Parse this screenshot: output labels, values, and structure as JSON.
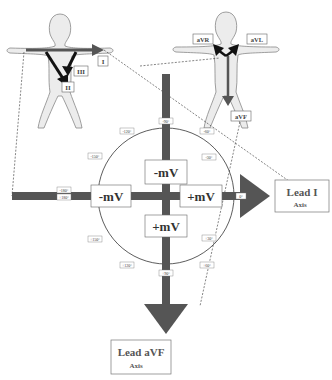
{
  "header": {
    "caption_fragment": ""
  },
  "figure": {
    "limb_leads_figure": {
      "labels": [
        "I",
        "II",
        "III"
      ]
    },
    "augmented_leads_figure": {
      "labels": [
        "aVR",
        "aVL",
        "aVF"
      ]
    },
    "hexaxial": {
      "degree_labels": {
        "top": "-90°",
        "upper_left": "-120°",
        "upper_right": "-60°",
        "right_upper": "-30°",
        "left_upper": "-150°",
        "left_top": "-180°",
        "left_bottom": "+180°",
        "right": "0°",
        "right_lower": "+30°",
        "lower_right": "+60°",
        "bottom": "+90°",
        "lower_left": "+120°",
        "left_lower": "+150°"
      },
      "quadrant_labels": {
        "top": "-mV",
        "left": "-mV",
        "right": "+mV",
        "bottom": "+mV"
      }
    },
    "lead_i_axis": {
      "title": "Lead I",
      "subtitle": "Axis"
    },
    "lead_avf_axis": {
      "title": "Lead aVF",
      "subtitle": "Axis"
    },
    "colors": {
      "axis_bar": "#555555",
      "body_fill": "#ececec",
      "body_stroke": "#888888",
      "arrow_black": "#111111"
    }
  }
}
